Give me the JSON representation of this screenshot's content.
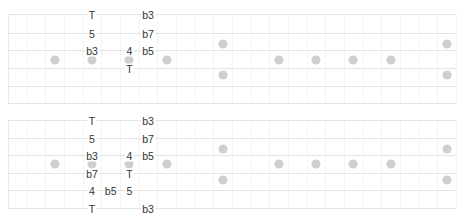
{
  "layout": {
    "left_x": 8,
    "right_x": 456,
    "fret_width": 18.67,
    "fret_count": 24
  },
  "colors": {
    "string": "#e4e4e4",
    "fret": "#f3f3f3",
    "inlay": "#cfcfcf",
    "text": "#333333"
  },
  "diagrams": [
    {
      "name": "diagram-top",
      "string_y": [
        14,
        33,
        50,
        68,
        86,
        103
      ],
      "inlays": [
        {
          "fret": 2,
          "y": 60
        },
        {
          "fret": 4,
          "y": 60
        },
        {
          "fret": 6,
          "y": 60
        },
        {
          "fret": 8,
          "y": 60
        },
        {
          "fret": 11,
          "y": 44
        },
        {
          "fret": 11,
          "y": 75
        },
        {
          "fret": 14,
          "y": 60
        },
        {
          "fret": 16,
          "y": 60
        },
        {
          "fret": 18,
          "y": 60
        },
        {
          "fret": 20,
          "y": 60
        },
        {
          "fret": 23,
          "y": 44
        },
        {
          "fret": 23,
          "y": 75
        }
      ],
      "notes": [
        {
          "fret": 4,
          "string": 0,
          "label": "T"
        },
        {
          "fret": 4,
          "string": 1,
          "label": "5"
        },
        {
          "fret": 4,
          "string": 2,
          "label": "b3"
        },
        {
          "fret": 6,
          "string": 2,
          "label": "4"
        },
        {
          "fret": 6,
          "string": 3,
          "label": "T"
        },
        {
          "fret": 7,
          "string": 0,
          "label": "b3"
        },
        {
          "fret": 7,
          "string": 1,
          "label": "b7"
        },
        {
          "fret": 7,
          "string": 2,
          "label": "b5"
        }
      ]
    },
    {
      "name": "diagram-bottom",
      "string_y": [
        120,
        138,
        155,
        173,
        190,
        208
      ],
      "inlays": [
        {
          "fret": 2,
          "y": 164
        },
        {
          "fret": 4,
          "y": 164
        },
        {
          "fret": 6,
          "y": 164
        },
        {
          "fret": 8,
          "y": 164
        },
        {
          "fret": 11,
          "y": 149
        },
        {
          "fret": 11,
          "y": 180
        },
        {
          "fret": 14,
          "y": 164
        },
        {
          "fret": 16,
          "y": 164
        },
        {
          "fret": 18,
          "y": 164
        },
        {
          "fret": 20,
          "y": 164
        },
        {
          "fret": 23,
          "y": 149
        },
        {
          "fret": 23,
          "y": 180
        }
      ],
      "notes": [
        {
          "fret": 4,
          "string": 0,
          "label": "T"
        },
        {
          "fret": 4,
          "string": 1,
          "label": "5"
        },
        {
          "fret": 4,
          "string": 2,
          "label": "b3"
        },
        {
          "fret": 4,
          "string": 3,
          "label": "b7"
        },
        {
          "fret": 4,
          "string": 4,
          "label": "4"
        },
        {
          "fret": 4,
          "string": 5,
          "label": "T"
        },
        {
          "fret": 5,
          "string": 4,
          "label": "b5"
        },
        {
          "fret": 6,
          "string": 2,
          "label": "4"
        },
        {
          "fret": 6,
          "string": 3,
          "label": "T"
        },
        {
          "fret": 6,
          "string": 4,
          "label": "5"
        },
        {
          "fret": 7,
          "string": 0,
          "label": "b3"
        },
        {
          "fret": 7,
          "string": 1,
          "label": "b7"
        },
        {
          "fret": 7,
          "string": 2,
          "label": "b5"
        },
        {
          "fret": 7,
          "string": 5,
          "label": "b3"
        }
      ]
    }
  ]
}
